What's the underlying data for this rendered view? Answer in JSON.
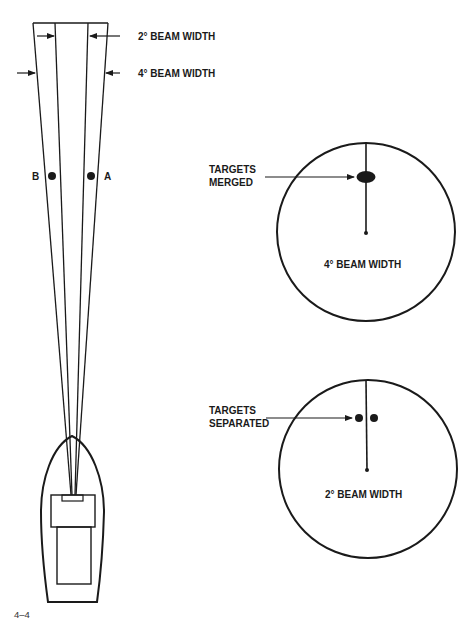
{
  "figure": {
    "number": "4–4",
    "colors": {
      "ink": "#1a1a1a",
      "background": "#ffffff"
    }
  },
  "beam": {
    "label_2deg": "2° BEAM WIDTH",
    "label_4deg": "4° BEAM WIDTH",
    "target_a": "A",
    "target_b": "B"
  },
  "scope_top": {
    "callout": [
      "TARGETS",
      "MERGED"
    ],
    "caption": "4° BEAM WIDTH"
  },
  "scope_bottom": {
    "callout": [
      "TARGETS",
      "SEPARATED"
    ],
    "caption": "2° BEAM WIDTH"
  }
}
